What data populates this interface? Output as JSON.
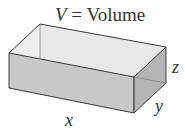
{
  "title": {
    "var": "V",
    "eq": " = ",
    "word": "Volume"
  },
  "labels": {
    "x": "x",
    "y": "y",
    "z": "z"
  },
  "colors": {
    "front_face": "#c8c8c8",
    "right_face": "#b0b0b0",
    "inner_back": "#e6e6e6",
    "inner_floor": "#dcdcdc",
    "edge": "#3a3a3a",
    "hidden_edge": "#8a8a8a",
    "text": "#333333"
  }
}
